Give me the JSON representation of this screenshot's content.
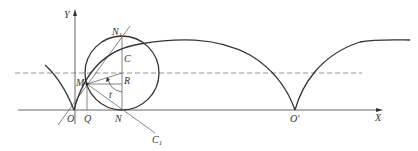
{
  "diagram": {
    "type": "cycloid-construction",
    "colors": {
      "curve": "#333333",
      "axis": "#555555",
      "dashed": "#777777",
      "construction": "#666666",
      "background": "#ffffff"
    },
    "labels": {
      "y_axis": "Y",
      "x_axis": "X",
      "origin": "O",
      "origin_prime": "O'",
      "q": "Q",
      "n": "N",
      "n1": "N",
      "n1_sub": "1",
      "c": "C",
      "r": "R",
      "m": "M",
      "t": "t",
      "c1": "C",
      "c1_sub": "1"
    }
  }
}
